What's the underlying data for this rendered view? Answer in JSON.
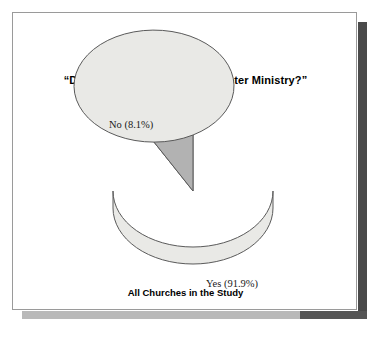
{
  "figure": {
    "exhibit_title": "Exhibit 5–4",
    "question_title": "“Does Your Church Have a Greeter Ministry?”",
    "caption": "All Churches in the Study",
    "label_no": "No (8.1%)",
    "label_yes": "Yes (91.9%)"
  },
  "colors": {
    "page_background": "#ffffff",
    "page_border": "#9a9a9a",
    "slice_yes_fill": "#e9e9e6",
    "slice_no_fill": "#b2b2b2",
    "slice_outline": "#5a5a5a",
    "pie_side_fill": "#dcdcda",
    "shadow_dark": "#4a4a4a",
    "shadow_light": "#b9b9b9",
    "text": "#000000"
  },
  "chart_data": {
    "type": "pie",
    "title": "“Does Your Church Have a Greeter Ministry?”",
    "subtitle": "Exhibit 5–4",
    "caption": "All Churches in the Study",
    "categories": [
      "Yes",
      "No"
    ],
    "values": [
      91.9,
      8.1
    ],
    "value_unit": "percent",
    "labels": [
      "Yes (91.9%)",
      "No (8.1%)"
    ],
    "slice_colors": [
      "#e9e9e6",
      "#b2b2b2"
    ],
    "start_angle_deg": 90,
    "direction": "counterclockwise",
    "three_d": true,
    "legend": "none",
    "grid": false
  }
}
